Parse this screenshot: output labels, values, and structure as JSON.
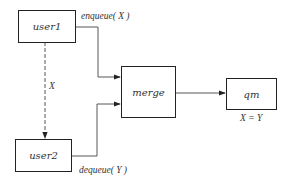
{
  "diagram": {
    "nodes": [
      {
        "id": "user1",
        "label": "user1"
      },
      {
        "id": "user2",
        "label": "user2"
      },
      {
        "id": "merge",
        "label": "merge"
      },
      {
        "id": "qm",
        "label": "qm"
      }
    ],
    "edges": [
      {
        "from": "user1",
        "to": "merge",
        "label": "enqueue( X )",
        "style": "solid"
      },
      {
        "from": "user2",
        "to": "merge",
        "label": "dequeue( Y )",
        "style": "solid"
      },
      {
        "from": "merge",
        "to": "qm",
        "label": "",
        "style": "solid"
      },
      {
        "from": "user1",
        "to": "user2",
        "label": "X",
        "style": "dashed"
      }
    ],
    "annotations": {
      "qm_condition": "X = Y"
    }
  }
}
